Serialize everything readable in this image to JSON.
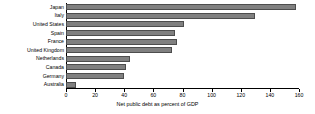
{
  "chart_data": {
    "type": "bar",
    "orientation": "horizontal",
    "title": "",
    "xlabel": "Net public debt as percent of GDP",
    "ylabel": "",
    "categories": [
      "Japan",
      "Italy",
      "United States",
      "Spain",
      "France",
      "United Kingdom",
      "Netherlands",
      "Canada",
      "Germany",
      "Australia"
    ],
    "values": [
      158,
      130,
      81,
      75,
      76,
      73,
      44,
      41,
      40,
      7
    ],
    "xlim": [
      0,
      160
    ],
    "xticks": [
      0,
      20,
      40,
      60,
      80,
      100,
      120,
      140,
      160
    ],
    "xtick_labels": [
      "0",
      "20",
      "40",
      "60",
      "80",
      "100",
      "120",
      "140",
      "160"
    ],
    "grid": false,
    "legend": null,
    "bar_color": "#808080",
    "bar_edge_color": "#4d4d4d",
    "axis_color": "#000000",
    "background_color": "#ffffff"
  }
}
